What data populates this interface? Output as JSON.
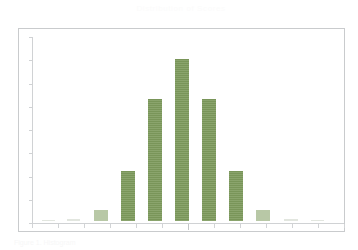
{
  "document": {
    "title": "Distribution of Scores",
    "caption": "Figure 1. Histogram"
  },
  "chart_data": {
    "type": "bar",
    "title": "Distribution of Scores",
    "xlabel": "",
    "ylabel": "",
    "grid": false,
    "legend": "none",
    "bar_color": "#7d9a5c",
    "axis_color": "#d0d2d4",
    "frame_color": "#c9cbcd",
    "background": "#ffffff",
    "xlim": [
      0,
      13
    ],
    "ylim": [
      0,
      180
    ],
    "categories": [
      "1",
      "2",
      "3",
      "4",
      "5",
      "6",
      "7",
      "8",
      "9",
      "10",
      "11",
      "12"
    ],
    "values": [
      0,
      1,
      10,
      50,
      122,
      162,
      122,
      50,
      10,
      1,
      0,
      0
    ],
    "y_tick_count": 9,
    "x_tick_count": 13,
    "bars": [
      {
        "category": "1",
        "value": 0,
        "x_px": 41,
        "width_px": 13,
        "height_px": 1
      },
      {
        "category": "2",
        "value": 1,
        "x_px": 66,
        "width_px": 13,
        "height_px": 2
      },
      {
        "category": "3",
        "value": 10,
        "x_px": 93,
        "width_px": 14,
        "height_px": 11
      },
      {
        "category": "4",
        "value": 50,
        "x_px": 120,
        "width_px": 14,
        "height_px": 50
      },
      {
        "category": "5",
        "value": 122,
        "x_px": 147,
        "width_px": 14,
        "height_px": 122
      },
      {
        "category": "6",
        "value": 162,
        "x_px": 174,
        "width_px": 14,
        "height_px": 162
      },
      {
        "category": "7",
        "value": 122,
        "x_px": 201,
        "width_px": 14,
        "height_px": 122
      },
      {
        "category": "8",
        "value": 50,
        "x_px": 228,
        "width_px": 14,
        "height_px": 50
      },
      {
        "category": "9",
        "value": 10,
        "x_px": 255,
        "width_px": 14,
        "height_px": 11
      },
      {
        "category": "10",
        "value": 1,
        "x_px": 283,
        "width_px": 14,
        "height_px": 2
      },
      {
        "category": "11",
        "value": 0,
        "x_px": 310,
        "width_px": 13,
        "height_px": 1
      }
    ]
  }
}
